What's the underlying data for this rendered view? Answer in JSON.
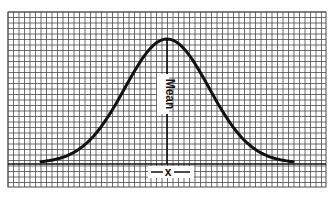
{
  "chart_data": {
    "type": "line",
    "title": "",
    "subtitle": "",
    "xlabel": "x̄",
    "ylabel": "",
    "grid": true,
    "legend": [],
    "annotations": [
      {
        "text": "Mean",
        "position": "along vertical line at peak",
        "orientation": "vertical"
      },
      {
        "text": "x",
        "position": "below baseline at mean",
        "style": "x-bar with flanking lines"
      }
    ],
    "series": [
      {
        "name": "Normal distribution",
        "x": [
          -3,
          -2.5,
          -2,
          -1.5,
          -1,
          -0.5,
          0,
          0.5,
          1,
          1.5,
          2,
          2.5,
          3
        ],
        "values": [
          0.0044,
          0.0175,
          0.054,
          0.1295,
          0.242,
          0.352,
          0.399,
          0.352,
          0.242,
          0.1295,
          0.054,
          0.0175,
          0.0044
        ]
      }
    ],
    "xlim": [
      -3,
      3
    ],
    "ylim": [
      0,
      0.4
    ],
    "mean": 0
  },
  "labels": {
    "mean": "Mean",
    "xbar": "x"
  },
  "colors": {
    "grid": "#4a4a4a",
    "curve": "#111111",
    "background": "#ffffff"
  }
}
